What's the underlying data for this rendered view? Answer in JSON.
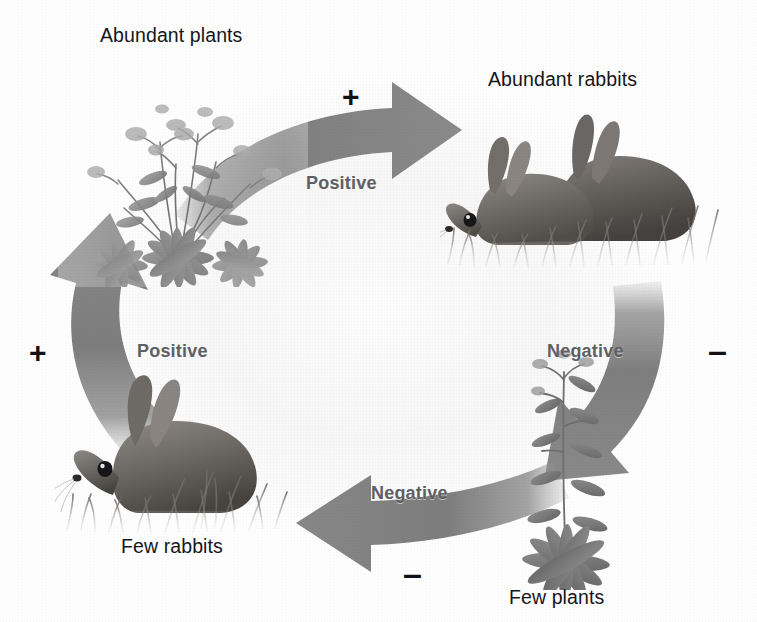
{
  "figure": {
    "background_color": "#fafafa",
    "arrow_color": "#8c8c8c",
    "label_color": "#15161a",
    "flow_label_color": "#5e6064"
  },
  "nodes": [
    {
      "id": "abundant-plants",
      "label": "Abundant plants",
      "position": "top-left",
      "art": "plants-many"
    },
    {
      "id": "abundant-rabbits",
      "label": "Abundant rabbits",
      "position": "top-right",
      "art": "rabbits-two"
    },
    {
      "id": "few-plants",
      "label": "Few plants",
      "position": "bottom-right",
      "art": "plant-one"
    },
    {
      "id": "few-rabbits",
      "label": "Few rabbits",
      "position": "bottom-left",
      "art": "rabbit-one"
    }
  ],
  "arrows": [
    {
      "id": "plants-to-rabbits",
      "label": "Positive",
      "sign": "+",
      "from": "abundant-plants",
      "to": "abundant-rabbits",
      "direction": "right"
    },
    {
      "id": "rabbits-to-plants",
      "label": "Negative",
      "sign": "–",
      "from": "abundant-rabbits",
      "to": "few-plants",
      "direction": "down"
    },
    {
      "id": "plants-to-few-rabbits",
      "label": "Negative",
      "sign": "–",
      "from": "few-plants",
      "to": "few-rabbits",
      "direction": "left"
    },
    {
      "id": "rabbits-to-plants-recover",
      "label": "Positive",
      "sign": "+",
      "from": "few-rabbits",
      "to": "abundant-plants",
      "direction": "up"
    }
  ],
  "flow_labels": {
    "top": "Positive",
    "right": "Negative",
    "bottom": "Negative",
    "left": "Positive"
  },
  "signs": {
    "top": "+",
    "right": "–",
    "bottom": "–",
    "left": "+"
  }
}
